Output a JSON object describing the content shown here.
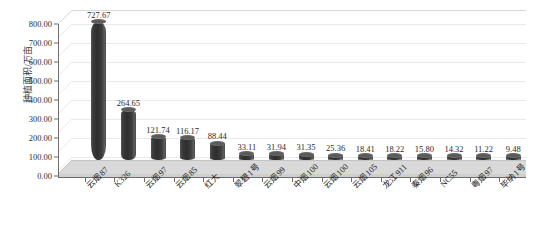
{
  "chart_data": {
    "type": "bar",
    "title": "",
    "xlabel": "",
    "ylabel": "种植面积/万亩",
    "ylim": [
      0,
      800
    ],
    "ytick_step": 100,
    "ytick_labels": [
      "0.00",
      "100.00",
      "200.00",
      "300.00",
      "400.00",
      "500.00",
      "600.00",
      "700.00",
      "800.00"
    ],
    "grid": true,
    "legend": "none",
    "style": "3d-cylinder",
    "categories": [
      "云烟87",
      "K326",
      "云烟97",
      "云烟85",
      "红大",
      "翠碧1号",
      "云烟99",
      "中烟100",
      "云烟100",
      "云烟105",
      "龙江911",
      "秦烟96",
      "NC55",
      "粤烟97",
      "毕纳1号"
    ],
    "values": [
      727.67,
      264.65,
      121.74,
      116.17,
      88.44,
      33.11,
      31.94,
      31.35,
      25.36,
      18.41,
      18.22,
      15.8,
      14.32,
      11.22,
      9.48
    ],
    "value_labels": [
      "727.67",
      "264.65",
      "121.74",
      "116.17",
      "88.44",
      "33.11",
      "31.94",
      "31.35",
      "25.36",
      "18.41",
      "18.22",
      "15.80",
      "14.32",
      "11.22",
      "9.48"
    ]
  },
  "colors": {
    "bar": "#3a3a3a",
    "bar_highlight": "#5c5c5c",
    "floor": "#d4d4d4",
    "wall": "#ffffff",
    "gridline": "#e9e9e9",
    "axis": "#6d6d6d",
    "text": "#2b2b2b"
  }
}
